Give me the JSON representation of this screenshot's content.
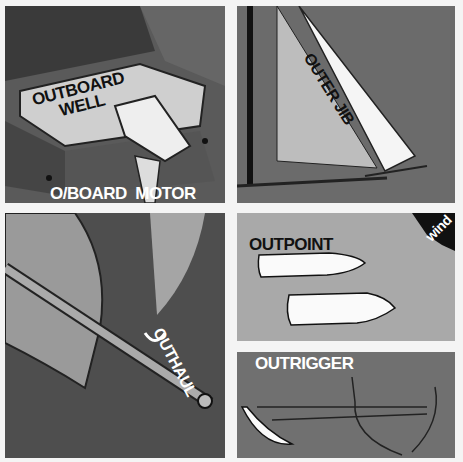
{
  "panels": [
    {
      "id": "outboard",
      "labels": {
        "well": [
          "OUTBOARD",
          "WELL"
        ],
        "motor": "O/BOARD  MOTOR"
      }
    },
    {
      "id": "outer-jib",
      "labels": {
        "title": "OUTER JIB"
      }
    },
    {
      "id": "outhaul",
      "labels": {
        "title": "OUTHAUL"
      }
    },
    {
      "id": "outpoint",
      "labels": {
        "title": "OUTPOINT",
        "arrow": "wind"
      }
    },
    {
      "id": "outrigger",
      "labels": {
        "title": "OUTRIGGER"
      }
    }
  ],
  "colors": {
    "page": "#f4f4f4",
    "dark": "#4e4e4e",
    "mid": "#6b6b6b",
    "light": "#a9a9a9",
    "ink": "#111111",
    "white": "#ffffff"
  }
}
